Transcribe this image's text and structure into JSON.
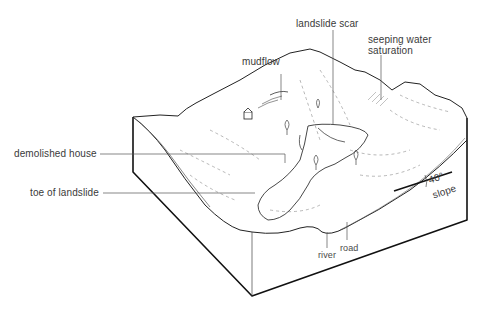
{
  "diagram": {
    "labels": {
      "landslide_scar": "landslide scar",
      "seeping_water_1": "seeping water",
      "seeping_water_2": "saturation",
      "mudflow": "mudflow",
      "demolished_house": "demolished house",
      "toe_of_landslide": "toe of  landslide",
      "angle": "40°",
      "slope": "slope",
      "road": "road",
      "river": "river"
    },
    "colors": {
      "outline": "#111111",
      "label_text": "#3a3a3a",
      "leader_line": "#555555",
      "sketch": "#777777"
    }
  }
}
